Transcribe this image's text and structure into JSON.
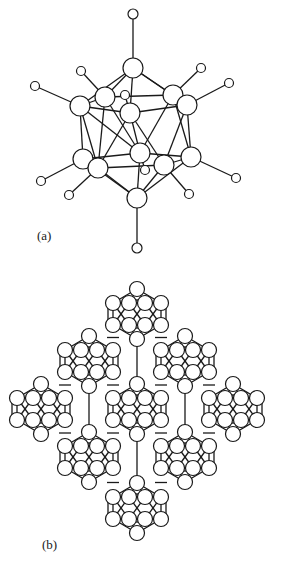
{
  "figure": {
    "panels": [
      {
        "id": "a",
        "label": "(a)",
        "description": "Single icosahedral cluster with terminal atoms",
        "top_atom": {
          "x": 133,
          "y": 68,
          "r": 10
        },
        "top_terminal": {
          "x": 133,
          "y": 14,
          "r": 5
        },
        "bottom_atom": {
          "x": 137,
          "y": 198,
          "r": 10
        },
        "bottom_terminal": {
          "x": 137,
          "y": 248,
          "r": 5
        },
        "upper_ring": [
          {
            "x": 80,
            "y": 106,
            "r": 10
          },
          {
            "x": 105,
            "y": 97,
            "r": 10
          },
          {
            "x": 130,
            "y": 113,
            "r": 10
          },
          {
            "x": 173,
            "y": 95,
            "r": 10
          },
          {
            "x": 187,
            "y": 105,
            "r": 10
          }
        ],
        "lower_ring": [
          {
            "x": 83,
            "y": 159,
            "r": 10
          },
          {
            "x": 98,
            "y": 168,
            "r": 10
          },
          {
            "x": 140,
            "y": 153,
            "r": 10
          },
          {
            "x": 164,
            "y": 165,
            "r": 10
          },
          {
            "x": 191,
            "y": 157,
            "r": 10
          }
        ],
        "upper_terminals": [
          {
            "x": 35,
            "y": 86,
            "r": 4.5,
            "to": 0
          },
          {
            "x": 81,
            "y": 71,
            "r": 4.5,
            "to": 1
          },
          {
            "x": 125,
            "y": 95,
            "r": 4.5,
            "to": 2
          },
          {
            "x": 201,
            "y": 68,
            "r": 4.5,
            "to": 3
          },
          {
            "x": 229,
            "y": 83,
            "r": 4.5,
            "to": 4
          }
        ],
        "lower_terminals": [
          {
            "x": 41,
            "y": 181,
            "r": 4.5,
            "to": 0
          },
          {
            "x": 69,
            "y": 195,
            "r": 4.5,
            "to": 1
          },
          {
            "x": 145,
            "y": 170,
            "r": 4.5,
            "to": 2
          },
          {
            "x": 189,
            "y": 194,
            "r": 4.5,
            "to": 3
          },
          {
            "x": 236,
            "y": 178,
            "r": 4.5,
            "to": 4
          }
        ]
      },
      {
        "id": "b",
        "label": "(b)",
        "description": "Diamond-shaped packing of nine icosahedral clusters linked by bonds",
        "atom_radius": 7.5,
        "clusters": [
          {
            "cx": 137,
            "cy": 314
          },
          {
            "cx": 89,
            "cy": 361
          },
          {
            "cx": 185,
            "cy": 361
          },
          {
            "cx": 41,
            "cy": 409
          },
          {
            "cx": 137,
            "cy": 409
          },
          {
            "cx": 233,
            "cy": 409
          },
          {
            "cx": 89,
            "cy": 457
          },
          {
            "cx": 185,
            "cy": 457
          },
          {
            "cx": 137,
            "cy": 508
          }
        ]
      }
    ]
  },
  "labels": {
    "a": "(a)",
    "b": "(b)"
  }
}
